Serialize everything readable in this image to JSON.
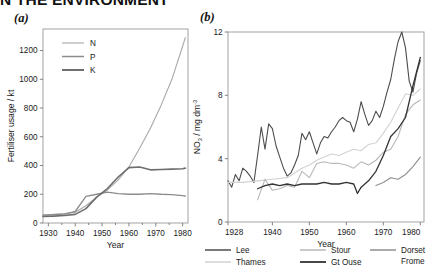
{
  "figure": {
    "clipped_title": "N THE ENVIRONMENT",
    "panel_a_letter": "(a)",
    "panel_b_letter": "(b)"
  },
  "chart_data": [
    {
      "type": "line",
      "panel": "(a)",
      "title": "",
      "xlabel": "Year",
      "ylabel": "Fertiliser usage / kt",
      "xlim": [
        1928,
        1982
      ],
      "ylim": [
        0,
        1350
      ],
      "xticks": [
        1930,
        1940,
        1950,
        1960,
        1970,
        1980
      ],
      "xticklabels": [
        "1930",
        "1940",
        "1950",
        "1960",
        "1970",
        "1980"
      ],
      "yticks": [
        0,
        200,
        400,
        600,
        800,
        1000,
        1200
      ],
      "yticklabels": [
        "0",
        "200",
        "400",
        "600",
        "800",
        "1000",
        "1200"
      ],
      "grid": false,
      "legend_position": "upper-left-inside",
      "series": [
        {
          "name": "N",
          "color": "#a8a8a8",
          "width": 1.1,
          "x": [
            1928,
            1932,
            1936,
            1940,
            1944,
            1948,
            1952,
            1956,
            1960,
            1964,
            1968,
            1972,
            1976,
            1980,
            1981
          ],
          "values": [
            55,
            60,
            65,
            75,
            120,
            180,
            230,
            300,
            390,
            520,
            660,
            820,
            1000,
            1230,
            1290
          ]
        },
        {
          "name": "P",
          "color": "#8c8c8c",
          "width": 1.3,
          "x": [
            1928,
            1932,
            1936,
            1940,
            1944,
            1948,
            1952,
            1956,
            1960,
            1964,
            1968,
            1972,
            1976,
            1980,
            1981
          ],
          "values": [
            55,
            58,
            62,
            80,
            185,
            200,
            215,
            205,
            200,
            200,
            205,
            200,
            198,
            190,
            188
          ]
        },
        {
          "name": "K",
          "color": "#6e6e6e",
          "width": 1.6,
          "x": [
            1928,
            1932,
            1936,
            1940,
            1944,
            1948,
            1952,
            1956,
            1960,
            1964,
            1968,
            1972,
            1976,
            1980,
            1981
          ],
          "values": [
            45,
            48,
            52,
            60,
            100,
            180,
            240,
            320,
            385,
            390,
            370,
            372,
            375,
            378,
            382
          ]
        }
      ]
    },
    {
      "type": "line",
      "panel": "(b)",
      "title": "",
      "xlabel": "Year",
      "ylabel": "NO3 / mg dm-3",
      "ylabel_parts": {
        "base": "NO",
        "sub": "3",
        "mid": " / mg dm",
        "sup": "-3"
      },
      "xlim": [
        1928,
        1981
      ],
      "ylim": [
        0,
        12
      ],
      "xticks": [
        1928,
        1940,
        1950,
        1960,
        1970,
        1980
      ],
      "xticklabels": [
        "1928",
        "1940",
        "1950",
        "1960",
        "1970",
        "1980"
      ],
      "yticks": [
        0,
        4,
        8,
        12
      ],
      "yticklabels": [
        "0",
        "4",
        "8",
        "12"
      ],
      "grid": false,
      "legend_position": "below-axes",
      "legend_entries": [
        "Lee",
        "Thames",
        "Stour",
        "Gt Ouse",
        "Dorset Frome"
      ],
      "series": [
        {
          "name": "Lee",
          "color": "#4d4d4d",
          "width": 1.1,
          "x": [
            1928,
            1929,
            1930,
            1931,
            1932,
            1933,
            1934,
            1935,
            1936,
            1937,
            1938,
            1939,
            1940,
            1941,
            1942,
            1943,
            1944,
            1945,
            1946,
            1947,
            1948,
            1949,
            1950,
            1951,
            1952,
            1953,
            1954,
            1955,
            1956,
            1957,
            1958,
            1959,
            1960,
            1961,
            1962,
            1963,
            1964,
            1965,
            1966,
            1967,
            1968,
            1969,
            1970,
            1971,
            1972,
            1973,
            1974,
            1975,
            1976,
            1977,
            1978,
            1979,
            1980
          ],
          "values": [
            2.6,
            2.2,
            3.0,
            2.6,
            3.4,
            3.2,
            2.9,
            2.5,
            4.2,
            6.0,
            4.6,
            6.2,
            5.9,
            4.8,
            4.1,
            3.4,
            2.9,
            3.1,
            3.6,
            4.2,
            5.6,
            5.2,
            5.7,
            5.0,
            4.3,
            5.0,
            5.4,
            5.3,
            5.7,
            6.0,
            6.4,
            6.6,
            6.4,
            6.3,
            5.7,
            6.5,
            7.6,
            6.8,
            6.1,
            6.4,
            7.0,
            6.6,
            7.3,
            8.2,
            9.0,
            10.3,
            11.4,
            12.0,
            11.0,
            8.9,
            8.2,
            9.4,
            10.2
          ]
        },
        {
          "name": "Thames",
          "color": "#d2d2d2",
          "width": 1.1,
          "x": [
            1928,
            1932,
            1936,
            1940,
            1944,
            1948,
            1950,
            1952,
            1954,
            1956,
            1958,
            1960,
            1962,
            1964,
            1966,
            1968,
            1970,
            1972,
            1974,
            1976,
            1978,
            1980
          ],
          "values": [
            2.5,
            2.5,
            2.6,
            2.7,
            2.8,
            3.4,
            3.6,
            3.9,
            4.1,
            4.3,
            4.2,
            4.4,
            4.6,
            4.5,
            4.9,
            5.0,
            5.6,
            6.3,
            7.2,
            8.1,
            8.0,
            8.4
          ]
        },
        {
          "name": "Stour",
          "color": "#b8b8b8",
          "width": 1.1,
          "x": [
            1936,
            1938,
            1940,
            1942,
            1944,
            1946,
            1948,
            1950,
            1952,
            1954,
            1956,
            1958,
            1960,
            1962,
            1964,
            1966,
            1968,
            1970,
            1972,
            1974,
            1976,
            1978,
            1980
          ],
          "values": [
            1.4,
            2.7,
            2.0,
            2.1,
            2.3,
            2.2,
            3.2,
            2.8,
            3.7,
            3.8,
            3.7,
            3.7,
            3.6,
            3.4,
            3.8,
            3.6,
            3.9,
            4.4,
            4.6,
            5.4,
            6.8,
            7.4,
            7.7
          ]
        },
        {
          "name": "Gt Ouse",
          "color": "#333333",
          "width": 1.3,
          "x": [
            1936,
            1938,
            1940,
            1942,
            1944,
            1946,
            1948,
            1950,
            1952,
            1954,
            1956,
            1958,
            1960,
            1962,
            1963,
            1964,
            1966,
            1968,
            1970,
            1972,
            1974,
            1976,
            1978,
            1980
          ],
          "values": [
            2.1,
            2.3,
            2.4,
            2.3,
            2.4,
            2.3,
            2.4,
            2.4,
            2.4,
            2.5,
            2.4,
            2.4,
            2.5,
            2.4,
            1.8,
            2.2,
            2.6,
            3.2,
            4.2,
            5.4,
            5.9,
            6.6,
            8.6,
            10.4
          ]
        },
        {
          "name": "Dorset Frome",
          "color": "#8f8f8f",
          "width": 1.1,
          "x": [
            1968,
            1970,
            1972,
            1974,
            1976,
            1978,
            1980
          ],
          "values": [
            2.3,
            2.5,
            2.8,
            2.7,
            3.0,
            3.5,
            4.1
          ]
        }
      ]
    }
  ],
  "legend_a": [
    {
      "label": "N",
      "color": "#a8a8a8",
      "width": 1.1
    },
    {
      "label": "P",
      "color": "#8c8c8c",
      "width": 1.5
    },
    {
      "label": "K",
      "color": "#6e6e6e",
      "width": 2.0
    }
  ],
  "legend_b": [
    {
      "label": "Lee",
      "color": "#4d4d4d",
      "width": 1.5
    },
    {
      "label": "Stour",
      "color": "#b8b8b8",
      "width": 1.5
    },
    {
      "label": "Dorset",
      "label2": "Frome",
      "color": "#8f8f8f",
      "width": 1.5
    },
    {
      "label": "Thames",
      "color": "#d2d2d2",
      "width": 1.5
    },
    {
      "label": "Gt Ouse",
      "color": "#333333",
      "width": 1.8
    }
  ]
}
